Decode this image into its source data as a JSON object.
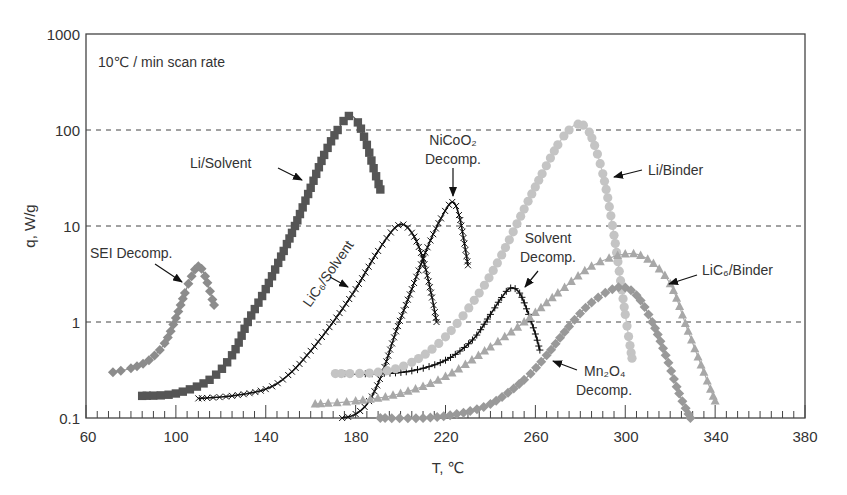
{
  "chart_data": {
    "type": "line",
    "title": "",
    "annotation": "10℃ / min scan rate",
    "xlabel": "T, ℃",
    "ylabel": "q, W/g",
    "xlim": [
      60,
      380
    ],
    "ylim": [
      0.1,
      1000
    ],
    "yscale": "log",
    "x_ticks": [
      60,
      100,
      140,
      180,
      220,
      260,
      300,
      340,
      380
    ],
    "y_ticks": [
      "0.1",
      "1",
      "10",
      "100",
      "1000"
    ],
    "grid": "horizontal dashed at 1, 10, 100",
    "legend": "none (inline arrow labels)",
    "series": [
      {
        "name": "SEI Decomp.",
        "color": "#8c8c8c",
        "marker": "diamond",
        "x": [
          72,
          80,
          88,
          95,
          100,
          104,
          107,
          110,
          113,
          117
        ],
        "y": [
          0.3,
          0.33,
          0.4,
          0.6,
          1.1,
          2.0,
          3.0,
          3.8,
          3.0,
          1.5
        ]
      },
      {
        "name": "Li/Solvent",
        "color": "#555555",
        "marker": "square",
        "x": [
          85,
          100,
          115,
          125,
          132,
          140,
          148,
          153,
          160,
          166,
          172,
          177,
          181,
          185,
          188,
          191
        ],
        "y": [
          0.17,
          0.18,
          0.25,
          0.45,
          1.0,
          2.2,
          5.5,
          10,
          25,
          55,
          100,
          140,
          120,
          70,
          40,
          24
        ]
      },
      {
        "name": "LiC6/Solvent",
        "color": "#111111",
        "marker": "x",
        "x": [
          110,
          125,
          140,
          150,
          160,
          170,
          180,
          190,
          199,
          205,
          210,
          214,
          216
        ],
        "y": [
          0.16,
          0.17,
          0.2,
          0.28,
          0.5,
          1.0,
          2.2,
          5.5,
          10.2,
          8.5,
          4.5,
          1.8,
          1.0
        ]
      },
      {
        "name": "NiCoO2 Decomp.",
        "color": "#111111",
        "marker": "x",
        "x": [
          174,
          180,
          186,
          192,
          198,
          205,
          212,
          218,
          223,
          226,
          228,
          230
        ],
        "y": [
          0.1,
          0.11,
          0.15,
          0.3,
          0.8,
          2.2,
          6.0,
          12,
          17.8,
          13,
          7.5,
          3.9
        ]
      },
      {
        "name": "Solvent Decomp.",
        "color": "#111111",
        "marker": "tick",
        "x": [
          171,
          190,
          205,
          220,
          232,
          240,
          245,
          249,
          253,
          257,
          260,
          262
        ],
        "y": [
          0.29,
          0.29,
          0.31,
          0.4,
          0.65,
          1.2,
          1.8,
          2.26,
          2.0,
          1.2,
          0.75,
          0.51
        ]
      },
      {
        "name": "Li/Binder",
        "color": "#c4c4c4",
        "marker": "circle",
        "x": [
          171,
          190,
          205,
          220,
          235,
          245,
          255,
          263,
          270,
          275,
          279,
          284,
          290,
          295,
          300,
          303
        ],
        "y": [
          0.29,
          0.3,
          0.38,
          0.7,
          2.0,
          5.0,
          15,
          35,
          70,
          100,
          115,
          95,
          35,
          8,
          1.2,
          0.42
        ]
      },
      {
        "name": "LiC6/Binder",
        "color": "#a8a8a8",
        "marker": "triangle",
        "x": [
          162,
          180,
          200,
          220,
          240,
          255,
          270,
          285,
          300,
          310,
          320,
          328,
          335,
          340
        ],
        "y": [
          0.14,
          0.15,
          0.18,
          0.27,
          0.55,
          1.0,
          2.0,
          3.8,
          5.1,
          4.5,
          2.5,
          0.8,
          0.3,
          0.15
        ]
      },
      {
        "name": "Mn2O4 Decomp.",
        "color": "#999999",
        "marker": "diamond",
        "x": [
          191,
          210,
          225,
          240,
          255,
          265,
          275,
          285,
          297,
          305,
          312,
          318,
          324,
          329
        ],
        "y": [
          0.1,
          0.1,
          0.11,
          0.14,
          0.25,
          0.45,
          0.9,
          1.6,
          2.3,
          1.9,
          1.0,
          0.45,
          0.18,
          0.1
        ]
      }
    ],
    "labels": [
      {
        "text": "SEI Decomp.",
        "series": "SEI Decomp."
      },
      {
        "text": "Li/Solvent",
        "series": "Li/Solvent"
      },
      {
        "text": "LiC₆/Solvent",
        "series": "LiC6/Solvent"
      },
      {
        "text": "NiCoO₂",
        "text2": "Decomp.",
        "series": "NiCoO2 Decomp."
      },
      {
        "text": "Solvent",
        "text2": "Decomp.",
        "series": "Solvent Decomp."
      },
      {
        "text": "Li/Binder",
        "series": "Li/Binder"
      },
      {
        "text": "LiC₆/Binder",
        "series": "LiC6/Binder"
      },
      {
        "text": "Mn₂O₄",
        "text2": "Decomp.",
        "series": "Mn2O4 Decomp."
      }
    ]
  },
  "axes": {
    "x_tick_labels": [
      "60",
      "100",
      "140",
      "180",
      "220",
      "260",
      "300",
      "340",
      "380"
    ],
    "y_tick_labels": [
      "0.1",
      "1",
      "10",
      "100",
      "1000"
    ],
    "xlabel": "T, ℃",
    "ylabel": "q, W/g"
  },
  "annotation": "10℃ / min scan rate",
  "callouts": {
    "sei": "SEI Decomp.",
    "li_solvent": "Li/Solvent",
    "lic6_solvent": "LiC₆/Solvent",
    "nicoo2_1": "NiCoO₂",
    "nicoo2_2": "Decomp.",
    "solvent_1": "Solvent",
    "solvent_2": "Decomp.",
    "li_binder": "Li/Binder",
    "lic6_binder": "LiC₆/Binder",
    "mn2o4_1": "Mn₂O₄",
    "mn2o4_2": "Decomp."
  }
}
